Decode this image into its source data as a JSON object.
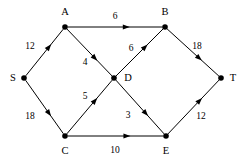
{
  "figure": {
    "type": "directed-weighted-graph",
    "width": 247,
    "height": 161,
    "background_color": "#ffffff",
    "stroke_color": "#000000",
    "text_color": "#000000"
  },
  "graph_data": {
    "nodes": [
      {
        "id": "S",
        "label": "S",
        "x": 24,
        "y": 78,
        "label_x": 13,
        "label_y": 78
      },
      {
        "id": "A",
        "label": "A",
        "x": 65,
        "y": 27,
        "label_x": 65,
        "label_y": 12
      },
      {
        "id": "C",
        "label": "C",
        "x": 65,
        "y": 136,
        "label_x": 65,
        "label_y": 151
      },
      {
        "id": "D",
        "label": "D",
        "x": 114,
        "y": 78,
        "label_x": 128,
        "label_y": 78
      },
      {
        "id": "B",
        "label": "B",
        "x": 165,
        "y": 27,
        "label_x": 165,
        "label_y": 12
      },
      {
        "id": "E",
        "label": "E",
        "x": 166,
        "y": 136,
        "label_x": 166,
        "label_y": 151
      },
      {
        "id": "T",
        "label": "T",
        "x": 221,
        "y": 78,
        "label_x": 233,
        "label_y": 78
      }
    ],
    "edges": [
      {
        "from": "S",
        "to": "A",
        "weight": "12",
        "label_x": 30,
        "label_y": 46
      },
      {
        "from": "S",
        "to": "C",
        "weight": "18",
        "label_x": 30,
        "label_y": 116
      },
      {
        "from": "A",
        "to": "B",
        "weight": "6",
        "label_x": 115,
        "label_y": 16
      },
      {
        "from": "A",
        "to": "D",
        "weight": "4",
        "label_x": 85,
        "label_y": 62
      },
      {
        "from": "C",
        "to": "D",
        "weight": "5",
        "label_x": 85,
        "label_y": 96
      },
      {
        "from": "C",
        "to": "E",
        "weight": "10",
        "label_x": 115,
        "label_y": 150
      },
      {
        "from": "D",
        "to": "B",
        "weight": "6",
        "label_x": 131,
        "label_y": 48
      },
      {
        "from": "D",
        "to": "E",
        "weight": "3",
        "label_x": 128,
        "label_y": 115
      },
      {
        "from": "B",
        "to": "T",
        "weight": "18",
        "label_x": 197,
        "label_y": 46
      },
      {
        "from": "E",
        "to": "T",
        "weight": "12",
        "label_x": 201,
        "label_y": 116
      }
    ]
  }
}
